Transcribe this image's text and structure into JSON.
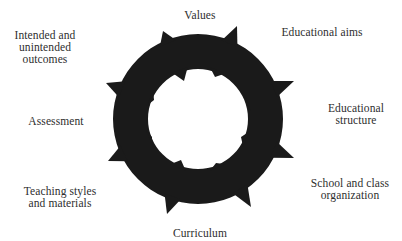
{
  "diagram": {
    "title": "",
    "center_shape": "spiked-ring",
    "ring_color": "#1a1a1a",
    "text_color": "#2e2e2e",
    "nodes": [
      {
        "id": "values",
        "lines": [
          "Values"
        ]
      },
      {
        "id": "aims",
        "lines": [
          "Educational aims"
        ]
      },
      {
        "id": "structure",
        "lines": [
          "Educational",
          "structure"
        ]
      },
      {
        "id": "school",
        "lines": [
          "School and class",
          "organization"
        ]
      },
      {
        "id": "curriculum",
        "lines": [
          "Curriculum"
        ]
      },
      {
        "id": "teaching",
        "lines": [
          "Teaching styles",
          "and materials"
        ]
      },
      {
        "id": "assessment",
        "lines": [
          "Assessment"
        ]
      },
      {
        "id": "outcomes",
        "lines": [
          "Intended and",
          "unintended",
          "outcomes"
        ]
      }
    ]
  }
}
